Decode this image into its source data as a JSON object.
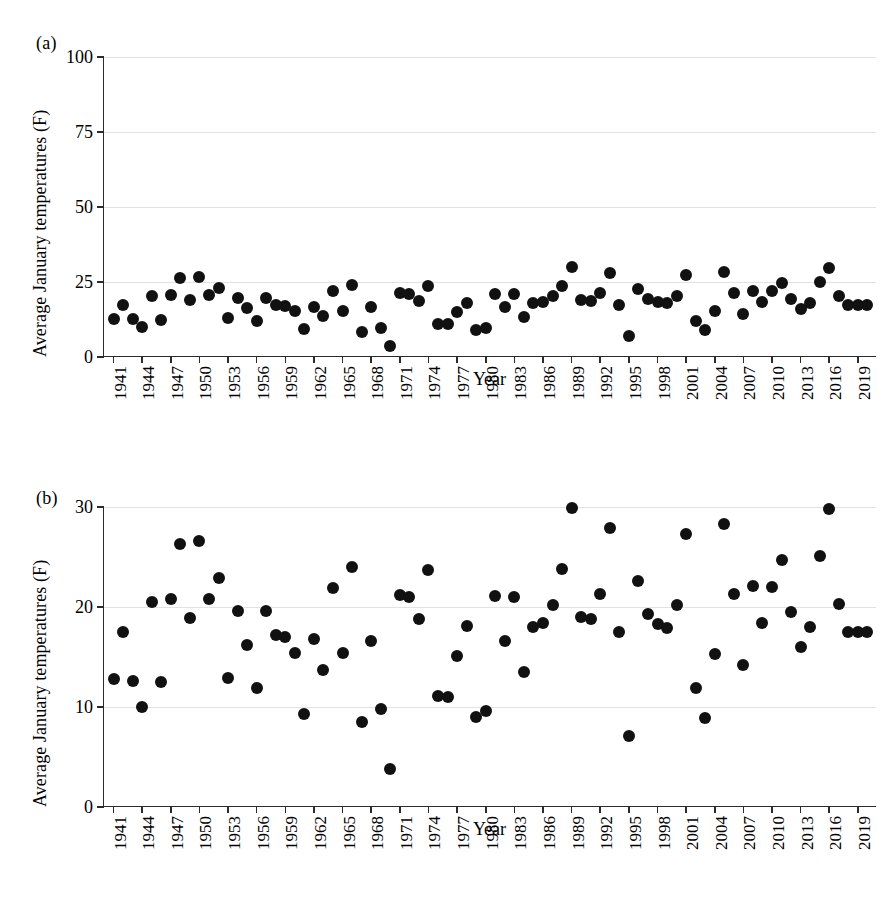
{
  "figure": {
    "panels": [
      {
        "letter": "(a)",
        "ylabel": "Average January temperatures (F)",
        "xlabel": "Year"
      },
      {
        "letter": "(b)",
        "ylabel": "Average January temperatures (F)",
        "xlabel": "Year"
      }
    ]
  },
  "chart_data": [
    {
      "type": "scatter",
      "title": "",
      "panel": "(a)",
      "xlabel": "Year",
      "ylabel": "Average January temperatures (F)",
      "xlim": [
        1940,
        2021
      ],
      "ylim": [
        0,
        100
      ],
      "yticks": [
        0,
        25,
        50,
        75,
        100
      ],
      "ytick_labels": [
        "0",
        "25",
        "50",
        "75",
        "100"
      ],
      "xticks": [
        1941,
        1944,
        1947,
        1950,
        1953,
        1956,
        1959,
        1962,
        1965,
        1968,
        1971,
        1974,
        1977,
        1980,
        1983,
        1986,
        1989,
        1992,
        1995,
        1998,
        2001,
        2004,
        2007,
        2010,
        2013,
        2016,
        2019
      ],
      "xtick_labels": [
        "1941",
        "1944",
        "1947",
        "1950",
        "1953",
        "1956",
        "1959",
        "1962",
        "1965",
        "1968",
        "1971",
        "1974",
        "1977",
        "1980",
        "1983",
        "1986",
        "1989",
        "1992",
        "1995",
        "1998",
        "2001",
        "2004",
        "2007",
        "2010",
        "2013",
        "2016",
        "2019"
      ],
      "grid": true,
      "grid_axis": "y",
      "legend": "none",
      "marker_color": "#111111",
      "x": [
        1941,
        1942,
        1943,
        1944,
        1945,
        1946,
        1947,
        1948,
        1949,
        1950,
        1951,
        1952,
        1953,
        1954,
        1955,
        1956,
        1957,
        1958,
        1959,
        1960,
        1961,
        1962,
        1963,
        1964,
        1965,
        1966,
        1967,
        1968,
        1969,
        1970,
        1971,
        1972,
        1973,
        1974,
        1975,
        1976,
        1977,
        1978,
        1979,
        1980,
        1981,
        1982,
        1983,
        1984,
        1985,
        1986,
        1987,
        1988,
        1989,
        1990,
        1991,
        1992,
        1993,
        1994,
        1995,
        1996,
        1997,
        1998,
        1999,
        2000,
        2001,
        2002,
        2003,
        2004,
        2005,
        2006,
        2007,
        2008,
        2009,
        2010,
        2011,
        2012,
        2013,
        2014,
        2015,
        2016,
        2017,
        2018,
        2019,
        2020
      ],
      "y": [
        12.8,
        17.5,
        12.6,
        10.0,
        20.5,
        12.5,
        20.8,
        26.3,
        18.9,
        26.6,
        20.8,
        22.9,
        12.9,
        19.6,
        16.2,
        11.9,
        19.6,
        17.2,
        17.0,
        15.4,
        9.3,
        16.8,
        13.7,
        21.9,
        15.4,
        24.0,
        8.5,
        16.6,
        9.8,
        3.8,
        21.2,
        21.0,
        18.8,
        23.7,
        11.1,
        11.0,
        15.1,
        18.1,
        9.0,
        9.6,
        21.1,
        16.6,
        21.0,
        13.5,
        18.0,
        18.4,
        20.2,
        23.8,
        29.9,
        19.0,
        18.8,
        21.3,
        27.9,
        17.5,
        7.1,
        22.6,
        19.3,
        18.3,
        17.9,
        20.2,
        27.3,
        11.9,
        8.9,
        15.3,
        28.3,
        21.3,
        14.2,
        22.1,
        18.4,
        22.0,
        24.7,
        19.5,
        16.0,
        18.0,
        25.1,
        29.8,
        20.3,
        17.5,
        17.5,
        17.5
      ]
    },
    {
      "type": "scatter",
      "title": "",
      "panel": "(b)",
      "xlabel": "Year",
      "ylabel": "Average January temperatures (F)",
      "xlim": [
        1940,
        2021
      ],
      "ylim": [
        0,
        30
      ],
      "yticks": [
        0,
        10,
        20,
        30
      ],
      "ytick_labels": [
        "0",
        "10",
        "20",
        "30"
      ],
      "xticks": [
        1941,
        1944,
        1947,
        1950,
        1953,
        1956,
        1959,
        1962,
        1965,
        1968,
        1971,
        1974,
        1977,
        1980,
        1983,
        1986,
        1989,
        1992,
        1995,
        1998,
        2001,
        2004,
        2007,
        2010,
        2013,
        2016,
        2019
      ],
      "xtick_labels": [
        "1941",
        "1944",
        "1947",
        "1950",
        "1953",
        "1956",
        "1959",
        "1962",
        "1965",
        "1968",
        "1971",
        "1974",
        "1977",
        "1980",
        "1983",
        "1986",
        "1989",
        "1992",
        "1995",
        "1998",
        "2001",
        "2004",
        "2007",
        "2010",
        "2013",
        "2016",
        "2019"
      ],
      "grid": true,
      "grid_axis": "y",
      "legend": "none",
      "marker_color": "#111111",
      "x": [
        1941,
        1942,
        1943,
        1944,
        1945,
        1946,
        1947,
        1948,
        1949,
        1950,
        1951,
        1952,
        1953,
        1954,
        1955,
        1956,
        1957,
        1958,
        1959,
        1960,
        1961,
        1962,
        1963,
        1964,
        1965,
        1966,
        1967,
        1968,
        1969,
        1970,
        1971,
        1972,
        1973,
        1974,
        1975,
        1976,
        1977,
        1978,
        1979,
        1980,
        1981,
        1982,
        1983,
        1984,
        1985,
        1986,
        1987,
        1988,
        1989,
        1990,
        1991,
        1992,
        1993,
        1994,
        1995,
        1996,
        1997,
        1998,
        1999,
        2000,
        2001,
        2002,
        2003,
        2004,
        2005,
        2006,
        2007,
        2008,
        2009,
        2010,
        2011,
        2012,
        2013,
        2014,
        2015,
        2016,
        2017,
        2018,
        2019,
        2020
      ],
      "y": [
        12.8,
        17.5,
        12.6,
        10.0,
        20.5,
        12.5,
        20.8,
        26.3,
        18.9,
        26.6,
        20.8,
        22.9,
        12.9,
        19.6,
        16.2,
        11.9,
        19.6,
        17.2,
        17.0,
        15.4,
        9.3,
        16.8,
        13.7,
        21.9,
        15.4,
        24.0,
        8.5,
        16.6,
        9.8,
        3.8,
        21.2,
        21.0,
        18.8,
        23.7,
        11.1,
        11.0,
        15.1,
        18.1,
        9.0,
        9.6,
        21.1,
        16.6,
        21.0,
        13.5,
        18.0,
        18.4,
        20.2,
        23.8,
        29.9,
        19.0,
        18.8,
        21.3,
        27.9,
        17.5,
        7.1,
        22.6,
        19.3,
        18.3,
        17.9,
        20.2,
        27.3,
        11.9,
        8.9,
        15.3,
        28.3,
        21.3,
        14.2,
        22.1,
        18.4,
        22.0,
        24.7,
        19.5,
        16.0,
        18.0,
        25.1,
        29.8,
        20.3,
        17.5,
        17.5,
        17.5
      ]
    }
  ]
}
